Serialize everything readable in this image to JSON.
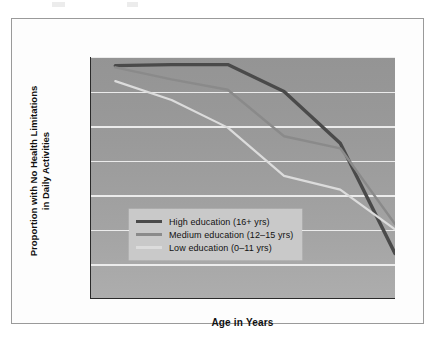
{
  "figure": {
    "background_color": "#fdfdfd",
    "border_color": "#9a9a9a",
    "plot_background_color": "#9b9b9b",
    "gridline_color": "#f2f2f2"
  },
  "axes": {
    "xlabel": "Age in Years",
    "ylabel_line1": "Proportion with No Health Limitations",
    "ylabel_line2": "in Daily Activities",
    "x_ticks": [
      "30",
      "40",
      "50",
      "60",
      "70",
      "85"
    ],
    "y_ticks": [
      "1.0",
      "0.9",
      "0.8",
      "0.7",
      "0.6",
      "0.5",
      "0.4",
      "0.3"
    ]
  },
  "legend": {
    "background_color": "#c9c9c9",
    "items": [
      {
        "label": "High education (16+ yrs)",
        "color": "#4a4a4a"
      },
      {
        "label": "Medium education (12–15 yrs)",
        "color": "#8a8a8a"
      },
      {
        "label": "Low education (0–11 yrs)",
        "color": "#dcdcdc"
      }
    ]
  },
  "chart_data": {
    "type": "line",
    "title": "",
    "xlabel": "Age in Years",
    "ylabel": "Proportion with No Health Limitations in Daily Activities",
    "x": [
      30,
      40,
      50,
      60,
      70,
      85
    ],
    "x_positions": [
      0.08,
      0.265,
      0.45,
      0.635,
      0.82,
      1.0
    ],
    "ylim": [
      0.3,
      1.0
    ],
    "ytick_values": [
      1.0,
      0.9,
      0.8,
      0.7,
      0.6,
      0.5,
      0.4,
      0.3
    ],
    "grid": true,
    "legend_position": "lower-left",
    "series": [
      {
        "name": "High education (16+ yrs)",
        "color": "#4a4a4a",
        "values": [
          0.975,
          0.978,
          0.978,
          0.9,
          0.75,
          0.43
        ]
      },
      {
        "name": "Medium education (12–15 yrs)",
        "color": "#8a8a8a",
        "values": [
          0.97,
          0.935,
          0.905,
          0.77,
          0.735,
          0.515
        ]
      },
      {
        "name": "Low education (0–11 yrs)",
        "color": "#dcdcdc",
        "values": [
          0.93,
          0.875,
          0.795,
          0.655,
          0.615,
          0.5
        ]
      }
    ]
  }
}
